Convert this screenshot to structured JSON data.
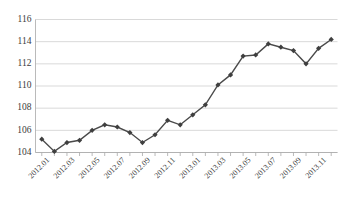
{
  "chart_data": {
    "type": "line",
    "title": "",
    "subtitle": "",
    "xlabel": "",
    "ylabel": "",
    "ylim": [
      104,
      116
    ],
    "ytick_step": 2,
    "grid": true,
    "legend": "none",
    "marker": "diamond",
    "line_color": "#4a4a4a",
    "marker_color": "#3f3f3f",
    "grid_color": "#c9c9c9",
    "axis_color": "#a8a8a8",
    "ytick_labels": [
      "104",
      "106",
      "108",
      "110",
      "112",
      "114",
      "116"
    ],
    "ytick_values": [
      104,
      106,
      108,
      110,
      112,
      114,
      116
    ],
    "xtick_labels": [
      "2012.01",
      "2012.03",
      "2012.05",
      "2012.07",
      "2012.09",
      "2012.11",
      "2013.01",
      "2013.03",
      "2013.05",
      "2013.07",
      "2013.09",
      "2013.11"
    ],
    "categories": [
      "2012.01",
      "2012.02",
      "2012.03",
      "2012.04",
      "2012.05",
      "2012.06",
      "2012.07",
      "2012.08",
      "2012.09",
      "2012.10",
      "2012.11",
      "2012.12",
      "2013.01",
      "2013.02",
      "2013.03",
      "2013.04",
      "2013.05",
      "2013.06",
      "2013.07",
      "2013.08",
      "2013.09",
      "2013.10",
      "2013.11",
      "2013.12"
    ],
    "values": [
      105.2,
      104.1,
      104.9,
      105.1,
      106.0,
      106.5,
      106.3,
      105.8,
      104.9,
      105.6,
      106.9,
      106.5,
      107.4,
      108.3,
      110.1,
      111.0,
      112.7,
      112.8,
      113.8,
      113.5,
      113.2,
      112.0,
      113.4,
      114.2
    ],
    "series": [
      {
        "name": "series-1",
        "values": [
          105.2,
          104.1,
          104.9,
          105.1,
          106.0,
          106.5,
          106.3,
          105.8,
          104.9,
          105.6,
          106.9,
          106.5,
          107.4,
          108.3,
          110.1,
          111.0,
          112.7,
          112.8,
          113.8,
          113.5,
          113.2,
          112.0,
          113.4,
          114.2
        ]
      }
    ]
  }
}
